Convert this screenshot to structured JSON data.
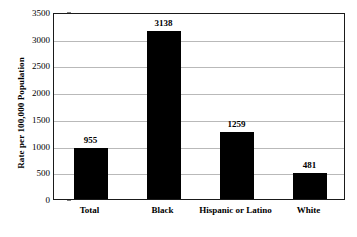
{
  "chart_data": {
    "type": "bar",
    "title": "",
    "xlabel": "",
    "ylabel": "Rate per 100,000 Population",
    "categories": [
      "Total",
      "Black",
      "Hispanic or Latino",
      "White"
    ],
    "values": [
      955,
      3138,
      1259,
      481
    ],
    "value_labels": [
      "955",
      "3138",
      "1259",
      "481"
    ],
    "ylim": [
      0,
      3500
    ],
    "ytick_labels": [
      "0",
      "500",
      "1000",
      "1500",
      "2000",
      "2500",
      "3000",
      "3500"
    ],
    "ytick_values": [
      0,
      500,
      1000,
      1500,
      2000,
      2500,
      3000,
      3500
    ],
    "grid": true,
    "legend": "none",
    "bar_color": "#000000",
    "gridline_color": "#b9b9b9",
    "plot_border_color": "#1a1a1a",
    "background_color": "#ffffff"
  }
}
